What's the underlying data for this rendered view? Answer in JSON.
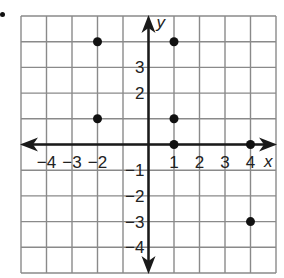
{
  "chart_data": {
    "type": "scatter",
    "title": "",
    "xlabel": "x",
    "ylabel": "y",
    "xlim": [
      -5,
      5
    ],
    "ylim": [
      -5,
      5
    ],
    "grid": true,
    "x_tick_labels": [
      "−4",
      "−3",
      "−2",
      "1",
      "2",
      "3",
      "4"
    ],
    "x_tick_values": [
      -4,
      -3,
      -2,
      1,
      2,
      3,
      4
    ],
    "y_tick_labels": [
      "3",
      "2",
      "−1",
      "−2",
      "−3",
      "−4"
    ],
    "y_tick_values": [
      3,
      2,
      -1,
      -2,
      -3,
      -4
    ],
    "points": [
      {
        "x": -2,
        "y": 4
      },
      {
        "x": 1,
        "y": 4
      },
      {
        "x": -2,
        "y": 1
      },
      {
        "x": 1,
        "y": 1
      },
      {
        "x": 1,
        "y": 0
      },
      {
        "x": 4,
        "y": 0
      },
      {
        "x": 4,
        "y": -3
      }
    ]
  },
  "colors": {
    "grid": "#8a8a8a",
    "axis": "#1a1a1a",
    "point": "#111111",
    "text": "#222222"
  }
}
